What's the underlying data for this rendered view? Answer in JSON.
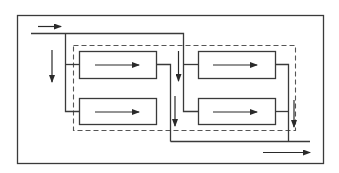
{
  "diagram": {
    "type": "flow-schematic",
    "colors": {
      "line": "#3a3a3a",
      "dashed_boundary": "#555555",
      "background": "#ffffff"
    },
    "outer_frame": {
      "x": 17,
      "y": 15,
      "w": 306,
      "h": 148
    },
    "dashed_boundary": {
      "x": 73,
      "y": 45,
      "w": 222,
      "h": 85
    },
    "units": [
      {
        "id": "unit-1",
        "stage": 1,
        "row": "top",
        "x": 79,
        "y": 51,
        "w": 77,
        "h": 27,
        "flow": "right"
      },
      {
        "id": "unit-2",
        "stage": 1,
        "row": "bottom",
        "x": 79,
        "y": 98,
        "w": 77,
        "h": 26,
        "flow": "right"
      },
      {
        "id": "unit-3",
        "stage": 2,
        "row": "top",
        "x": 198,
        "y": 51,
        "w": 77,
        "h": 27,
        "flow": "right"
      },
      {
        "id": "unit-4",
        "stage": 2,
        "row": "bottom",
        "x": 198,
        "y": 98,
        "w": 77,
        "h": 26,
        "flow": "right"
      }
    ],
    "flow_arrows": [
      {
        "id": "input-arrow",
        "direction": "right"
      },
      {
        "id": "left-down-arrow",
        "direction": "down"
      },
      {
        "id": "mid-down-arrow-1",
        "direction": "down"
      },
      {
        "id": "mid-down-arrow-2",
        "direction": "down"
      },
      {
        "id": "right-down-arrow",
        "direction": "down"
      },
      {
        "id": "output-arrow",
        "direction": "right"
      }
    ],
    "labels": []
  }
}
